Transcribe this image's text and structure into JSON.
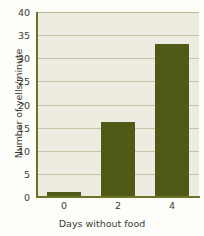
{
  "chart_data": {
    "type": "bar",
    "title": "",
    "subtitle": "",
    "xlabel": "Days without food",
    "ylabel": "Number of yells/minute",
    "categories": [
      "0",
      "2",
      "4"
    ],
    "values": [
      1,
      16.3,
      33
    ],
    "series": [
      {
        "name": "Number of yells/minute",
        "values": [
          1,
          16.3,
          33
        ]
      }
    ],
    "ylim": [
      0,
      40
    ],
    "yticks": [
      0,
      5,
      10,
      15,
      20,
      25,
      30,
      35,
      40
    ],
    "ytick_labels": [
      "0",
      "5",
      "10",
      "15",
      "20",
      "25",
      "30",
      "35",
      "40"
    ],
    "xtick_labels": [
      "0",
      "2",
      "4"
    ],
    "grid": "horizontal",
    "legend": "none",
    "annotations": [],
    "colors": {
      "bar": "#4f5a17",
      "plot_background": "#eeece0",
      "page_background": "#fdfdfa",
      "gridline": "#c8c3a4",
      "axis": "#6d7226",
      "text": "#3b3b38"
    }
  }
}
